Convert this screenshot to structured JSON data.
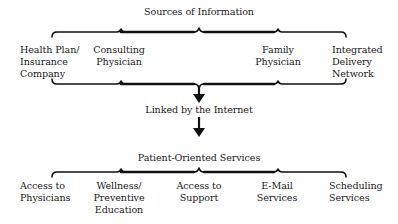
{
  "diagram": {
    "top_title": "Sources of Information",
    "sources": [
      {
        "label": "Health Plan/\nInsurance\nCompany"
      },
      {
        "label": "Consulting\nPhysician"
      },
      {
        "label": "Family\nPhysician"
      },
      {
        "label": "Integrated\nDelivery\nNetwork"
      }
    ],
    "link_label": "Linked by the Internet",
    "services_title": "Patient-Oriented Services",
    "services": [
      {
        "label": "Access to\nPhysicians"
      },
      {
        "label": "Wellness/\nPreventive\nEducation"
      },
      {
        "label": "Access to\nSupport"
      },
      {
        "label": "E-Mail\nServices"
      },
      {
        "label": "Scheduling\nServices"
      }
    ],
    "colors": {
      "line": "#111111",
      "text": "#1a1a1a",
      "background": "#ffffff"
    }
  }
}
